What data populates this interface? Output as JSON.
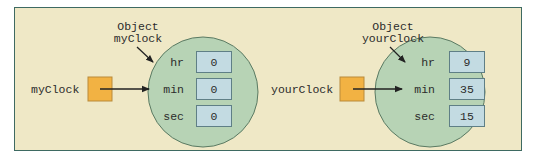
{
  "diagram": {
    "background_color": "#efe8c6",
    "border_color": "#3e6a62",
    "object_fill": "#b7d3b5",
    "field_fill": "#c3dbe2",
    "reference_fill": "#f2b243",
    "objects": [
      {
        "caption_line1": "Object",
        "caption_line2": "myClock",
        "variable_name": "myClock",
        "fields": [
          {
            "name": "hr",
            "value": "0"
          },
          {
            "name": "min",
            "value": "0"
          },
          {
            "name": "sec",
            "value": "0"
          }
        ]
      },
      {
        "caption_line1": "Object",
        "caption_line2": "yourClock",
        "variable_name": "yourClock",
        "fields": [
          {
            "name": "hr",
            "value": "9"
          },
          {
            "name": "min",
            "value": "35"
          },
          {
            "name": "sec",
            "value": "15"
          }
        ]
      }
    ]
  }
}
